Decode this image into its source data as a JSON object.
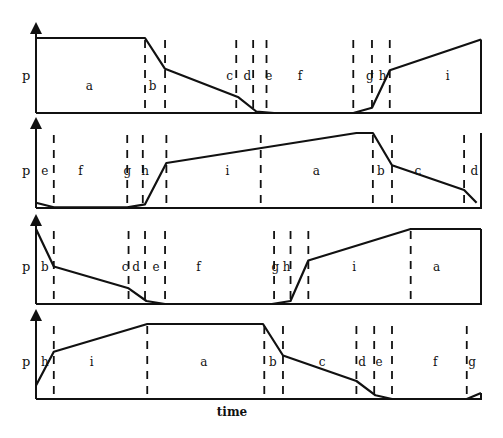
{
  "figure": {
    "y_axis_label": "p",
    "x_axis_label": "time",
    "line_color": "#111111",
    "background": "#ffffff"
  },
  "panels": [
    {
      "name": "panel-1",
      "phase_sequence": [
        "a",
        "b",
        "c",
        "d",
        "e",
        "f",
        "g",
        "h",
        "i"
      ],
      "phase_labels": [
        {
          "text": "a",
          "t": 0.12
        },
        {
          "text": "b",
          "t": 0.262
        },
        {
          "text": "c",
          "t": 0.435
        },
        {
          "text": "d",
          "t": 0.475
        },
        {
          "text": "e",
          "t": 0.523
        },
        {
          "text": "f",
          "t": 0.593
        },
        {
          "text": "g",
          "t": 0.75
        },
        {
          "text": "h",
          "t": 0.779
        },
        {
          "text": "i",
          "t": 0.925
        }
      ],
      "boundaries": [
        0.245,
        0.29,
        0.45,
        0.488,
        0.518,
        0.713,
        0.755,
        0.795
      ],
      "curve": [
        [
          0,
          1
        ],
        [
          0.245,
          1
        ],
        [
          0.29,
          0.59
        ],
        [
          0.455,
          0.21
        ],
        [
          0.495,
          0.02
        ],
        [
          0.535,
          0
        ],
        [
          0.713,
          0
        ],
        [
          0.755,
          0.07
        ],
        [
          0.795,
          0.57
        ],
        [
          1,
          0.98
        ]
      ],
      "right_drop": true
    },
    {
      "name": "panel-2",
      "phase_sequence": [
        "e",
        "f",
        "g",
        "h",
        "i",
        "a",
        "b",
        "c",
        "d"
      ],
      "phase_labels": [
        {
          "text": "e",
          "t": 0.02
        },
        {
          "text": "f",
          "t": 0.1
        },
        {
          "text": "g",
          "t": 0.205
        },
        {
          "text": "h",
          "t": 0.245
        },
        {
          "text": "i",
          "t": 0.43
        },
        {
          "text": "a",
          "t": 0.63
        },
        {
          "text": "b",
          "t": 0.775
        },
        {
          "text": "c",
          "t": 0.858
        },
        {
          "text": "d",
          "t": 0.985
        }
      ],
      "boundaries": [
        0.04,
        0.205,
        0.24,
        0.293,
        0.505,
        0.757,
        0.8,
        0.962
      ],
      "curve": [
        [
          0,
          0.07
        ],
        [
          0.04,
          0.01
        ],
        [
          0.205,
          0.01
        ],
        [
          0.245,
          0.05
        ],
        [
          0.293,
          0.6
        ],
        [
          0.72,
          1
        ],
        [
          0.757,
          1
        ],
        [
          0.8,
          0.57
        ],
        [
          0.962,
          0.24
        ],
        [
          0.99,
          0.07
        ]
      ],
      "right_drop": false
    },
    {
      "name": "panel-3",
      "phase_sequence": [
        "b",
        "c",
        "d",
        "e",
        "f",
        "g",
        "h",
        "i",
        "a"
      ],
      "phase_labels": [
        {
          "text": "b",
          "t": 0.02
        },
        {
          "text": "c",
          "t": 0.2
        },
        {
          "text": "d",
          "t": 0.225
        },
        {
          "text": "e",
          "t": 0.27
        },
        {
          "text": "f",
          "t": 0.365
        },
        {
          "text": "g",
          "t": 0.538
        },
        {
          "text": "h",
          "t": 0.563
        },
        {
          "text": "i",
          "t": 0.715
        },
        {
          "text": "a",
          "t": 0.9
        }
      ],
      "boundaries": [
        0.04,
        0.208,
        0.245,
        0.29,
        0.535,
        0.572,
        0.612,
        0.842
      ],
      "curve": [
        [
          0,
          1
        ],
        [
          0.04,
          0.5
        ],
        [
          0.208,
          0.21
        ],
        [
          0.248,
          0.04
        ],
        [
          0.29,
          0
        ],
        [
          0.53,
          0
        ],
        [
          0.572,
          0.04
        ],
        [
          0.612,
          0.58
        ],
        [
          0.842,
          1
        ],
        [
          1,
          1
        ]
      ],
      "right_drop": true,
      "left_start_at_axis": true
    },
    {
      "name": "panel-4",
      "phase_sequence": [
        "h",
        "i",
        "a",
        "b",
        "c",
        "d",
        "e",
        "f",
        "g"
      ],
      "phase_labels": [
        {
          "text": "h",
          "t": 0.02
        },
        {
          "text": "i",
          "t": 0.125
        },
        {
          "text": "a",
          "t": 0.377
        },
        {
          "text": "b",
          "t": 0.532
        },
        {
          "text": "c",
          "t": 0.643
        },
        {
          "text": "d",
          "t": 0.733
        },
        {
          "text": "e",
          "t": 0.771
        },
        {
          "text": "f",
          "t": 0.897
        },
        {
          "text": "g",
          "t": 0.98
        }
      ],
      "boundaries": [
        0.04,
        0.25,
        0.513,
        0.555,
        0.72,
        0.76,
        0.8,
        0.968
      ],
      "curve": [
        [
          0,
          0.18
        ],
        [
          0.04,
          0.63
        ],
        [
          0.25,
          1
        ],
        [
          0.51,
          1
        ],
        [
          0.555,
          0.58
        ],
        [
          0.72,
          0.24
        ],
        [
          0.763,
          0.05
        ],
        [
          0.8,
          0
        ],
        [
          0.968,
          0
        ],
        [
          1,
          0.08
        ]
      ],
      "right_drop": true
    }
  ]
}
